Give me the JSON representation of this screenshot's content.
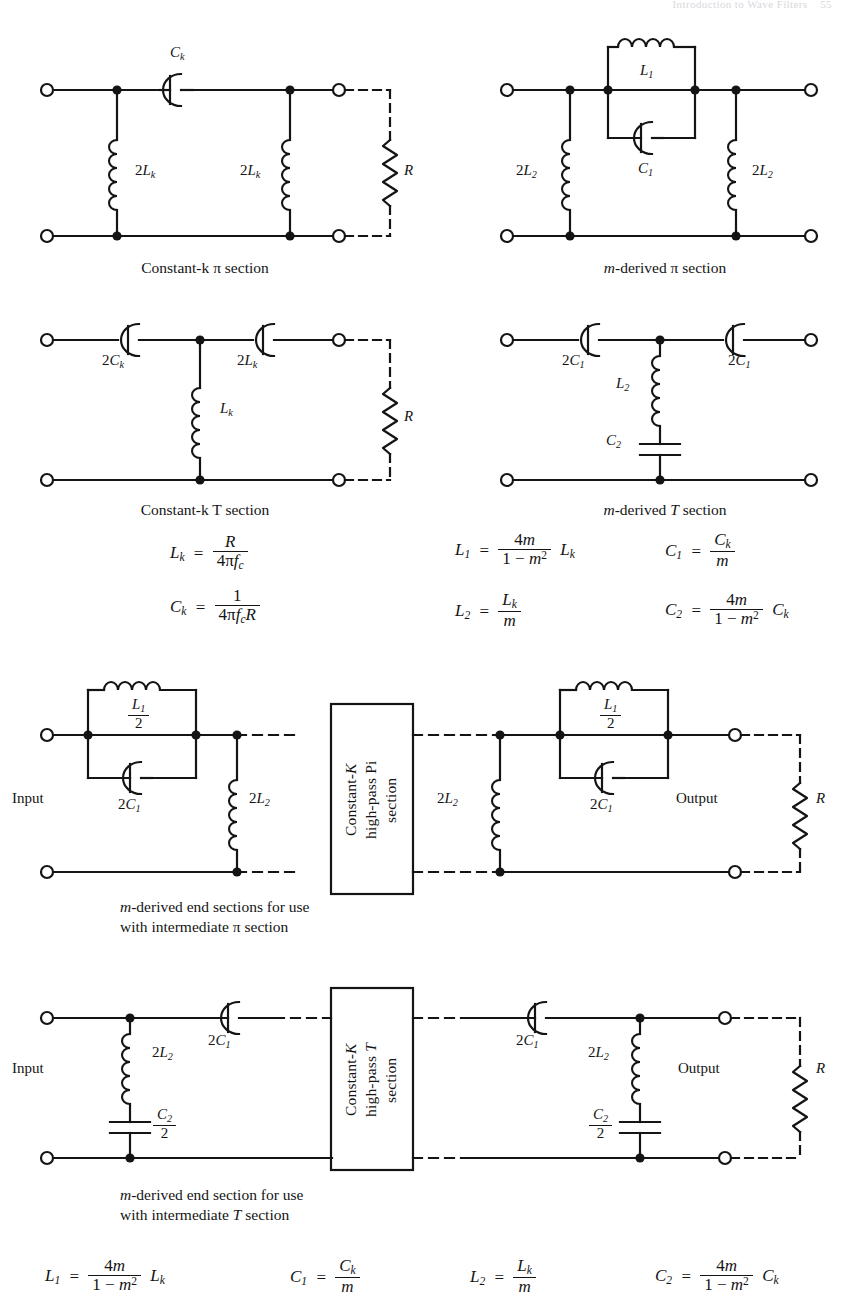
{
  "header": {
    "running_head": "Introduction to Wave Filters",
    "page_number": "55"
  },
  "figure": {
    "panels": [
      {
        "id": "constant-k-pi",
        "caption": "Constant-k π section",
        "components": [
          "Ck",
          "2Lk",
          "2Lk",
          "R"
        ]
      },
      {
        "id": "m-derived-pi",
        "caption": "m-derived π section",
        "components": [
          "L1",
          "C1",
          "2L2",
          "2L2"
        ]
      },
      {
        "id": "constant-k-t",
        "caption": "Constant-k T section",
        "components": [
          "2Ck",
          "2Ck",
          "Lk",
          "R"
        ]
      },
      {
        "id": "m-derived-t",
        "caption": "m-derived T section",
        "components": [
          "2C1",
          "2C1",
          "L2",
          "C2"
        ]
      },
      {
        "id": "m-derived-end-pi",
        "caption_line1": "m-derived end sections for use",
        "caption_line2": "with intermediate π section",
        "box_label": "Constant-K high-pass Pi section",
        "box_lines": [
          "Constant-K",
          "high-pass Pi",
          "section"
        ],
        "port_in": "Input",
        "port_out": "Output",
        "load": "R",
        "components": [
          "L1/2",
          "2C1",
          "2L2",
          "2L2",
          "L1/2",
          "2C1"
        ]
      },
      {
        "id": "m-derived-end-t",
        "caption_line1": "m-derived end section for use",
        "caption_line2": "with intermediate T section",
        "box_label": "Constant-K high-pass T section",
        "box_lines": [
          "Constant-K",
          "high-pass T",
          "section"
        ],
        "port_in": "Input",
        "port_out": "Output",
        "load": "R",
        "components": [
          "2L2",
          "C2/2",
          "2C1",
          "2C1",
          "2L2",
          "C2/2"
        ]
      }
    ],
    "labels": {
      "Ck": "C",
      "Ck_sub": "k",
      "two_Lk": "2L",
      "two_Lk_sub": "k",
      "L1": "L",
      "L1_sub": "1",
      "C1": "C",
      "C1_sub": "1",
      "two_L2": "2L",
      "two_L2_sub": "2",
      "two_Ck": "2C",
      "two_Ck_sub": "k",
      "Lk": "L",
      "Lk_sub": "k",
      "two_C1": "2C",
      "two_C1_sub": "1",
      "L2": "L",
      "L2_sub": "2",
      "C2": "C",
      "C2_sub": "2",
      "R": "R",
      "input": "Input",
      "output": "Output"
    },
    "equations_mid_left": [
      {
        "lhs": "L",
        "lhs_sub": "k",
        "num": "R",
        "den": "4πf",
        "den_sub": "c",
        "tail": ""
      },
      {
        "lhs": "C",
        "lhs_sub": "k",
        "num": "1",
        "den": "4πf",
        "den_sub": "c",
        "den_tail": "R",
        "tail": ""
      }
    ],
    "equations_mid_right": [
      {
        "lhs": "L",
        "lhs_sub": "1",
        "num": "4m",
        "den": "1 − m²",
        "tail": "L",
        "tail_sub": "k"
      },
      {
        "lhs": "C",
        "lhs_sub": "1",
        "num": "C",
        "num_sub": "k",
        "den": "m",
        "tail": ""
      },
      {
        "lhs": "L",
        "lhs_sub": "2",
        "num": "L",
        "num_sub": "k",
        "den": "m",
        "tail": ""
      },
      {
        "lhs": "C",
        "lhs_sub": "2",
        "num": "4m",
        "den": "1 − m²",
        "tail": "C",
        "tail_sub": "k"
      }
    ],
    "equations_bottom": [
      {
        "lhs": "L",
        "lhs_sub": "1",
        "num": "4m",
        "den": "1 − m²",
        "tail": "L",
        "tail_sub": "k"
      },
      {
        "lhs": "C",
        "lhs_sub": "1",
        "num": "C",
        "num_sub": "k",
        "den": "m",
        "tail": ""
      },
      {
        "lhs": "L",
        "lhs_sub": "2",
        "num": "L",
        "num_sub": "k",
        "den": "m",
        "tail": ""
      },
      {
        "lhs": "C",
        "lhs_sub": "2",
        "num": "4m",
        "den": "1 − m²",
        "tail": "C",
        "tail_sub": "k"
      }
    ],
    "colors": {
      "ink": "#141414",
      "paper": "#ffffff"
    }
  }
}
